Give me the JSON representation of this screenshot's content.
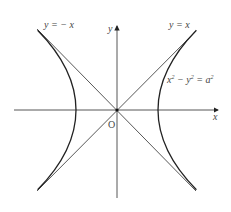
{
  "diagram": {
    "axes": {
      "x_label": "x",
      "y_label": "y",
      "origin_label": "O"
    },
    "asymptotes": [
      {
        "label": "y = − x",
        "slope": -1
      },
      {
        "label": "y = x",
        "slope": 1
      }
    ],
    "curve": {
      "equation_lhs": "x",
      "equation_mid": " − y",
      "equation_rhs": " = a",
      "exp": "2",
      "full_text": "x² − y² = a²",
      "a_px": 41
    },
    "colors": {
      "line": "#333333",
      "curve": "#222222",
      "text": "#444444",
      "background": "#ffffff"
    }
  }
}
